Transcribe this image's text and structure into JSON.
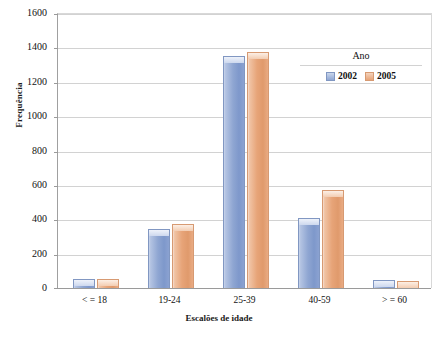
{
  "chart_data": {
    "type": "bar",
    "title": "",
    "xlabel": "Escalões de idade",
    "ylabel": "Frequência",
    "categories": [
      "< = 18",
      "19-24",
      "25-39",
      "40-59",
      "> = 60"
    ],
    "series": [
      {
        "name": "2002",
        "color": "#8fa6d2",
        "values": [
          55,
          345,
          1350,
          405,
          45
        ]
      },
      {
        "name": "2005",
        "color": "#e7a478",
        "values": [
          50,
          375,
          1375,
          570,
          40
        ]
      }
    ],
    "legend": {
      "title": "Ano",
      "position": "inside-top-right",
      "entries": [
        "2002",
        "2005"
      ]
    },
    "ylim": [
      0,
      1600
    ],
    "ytick_step": 200,
    "yticks": [
      "1600",
      "1400",
      "1200",
      "1000",
      "800",
      "600",
      "400",
      "200",
      "0"
    ],
    "grid": "horizontal"
  }
}
